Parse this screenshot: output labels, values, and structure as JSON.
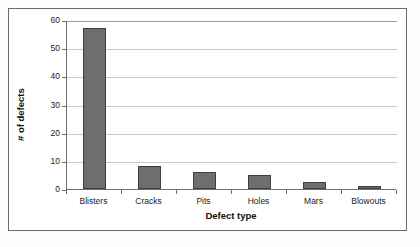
{
  "chart_data": {
    "type": "bar",
    "title": "",
    "xlabel": "Defect type",
    "ylabel": "# of defects",
    "categories": [
      "Blisters",
      "Cracks",
      "Pits",
      "Holes",
      "Mars",
      "Blowouts"
    ],
    "values": [
      57,
      8,
      6,
      5,
      2.5,
      1
    ],
    "ylim": [
      0,
      60
    ],
    "yticks": [
      0,
      10,
      20,
      30,
      40,
      50,
      60
    ],
    "ytick_labels": [
      "0",
      "10",
      "20",
      "30",
      "40",
      "50",
      "60"
    ],
    "grid": "horizontal",
    "legend": "none",
    "series": [
      {
        "name": "# of defects",
        "values": [
          57,
          8,
          6,
          5,
          2.5,
          1
        ],
        "color": "#6e6e6e",
        "edge_color": "#3f3f3f"
      }
    ],
    "colors": {
      "bar_fill": "#6e6e6e",
      "bar_edge": "#3f3f3f",
      "gridline": "#c9c9c9",
      "axis": "#6f6f6f",
      "frame": "#6b6b6b",
      "background": "#ffffff",
      "text": "#1c1c1c"
    }
  }
}
